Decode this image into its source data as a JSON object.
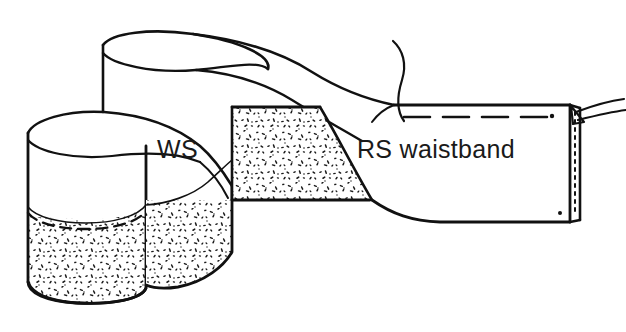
{
  "figure": {
    "kind": "line-drawing",
    "background_color": "#ffffff",
    "ink_color": "#111111",
    "stipple_color": "#1a1a1a",
    "width": 626,
    "height": 332
  },
  "labels": {
    "wrong_side": "WS",
    "right_side_waistband": "RS waistband"
  },
  "annotations": {
    "stitch_line_style": "dashed",
    "thread_tails_count": 2,
    "notch_dot_count": 2
  },
  "regions": {
    "left_end_top": "wrong-side-plain",
    "left_end_bottom": "interfaced-stippled",
    "center_band_lower": "interfaced-stippled",
    "right_band": "right-side-plain"
  },
  "colors": {
    "ink": "#111111",
    "paper": "#ffffff",
    "text": "#1a1a1a"
  }
}
